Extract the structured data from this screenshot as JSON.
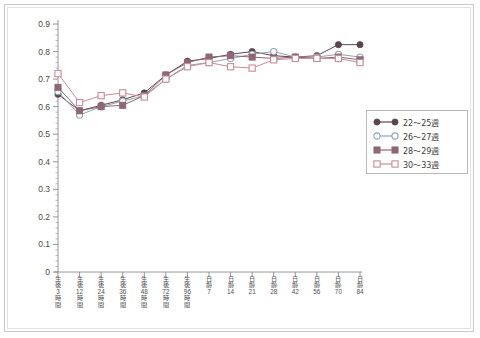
{
  "chart_data": {
    "type": "line",
    "title": "",
    "xlabel": "",
    "ylabel": "",
    "ylim": [
      0,
      0.9
    ],
    "ytick_labels": [
      "0.9",
      "0.8",
      "0.7",
      "0.6",
      "0.5",
      "0.4",
      "0.3",
      "0.2",
      "0.1",
      "0"
    ],
    "ytick_values": [
      0.9,
      0.8,
      0.7,
      0.6,
      0.5,
      0.4,
      0.3,
      0.2,
      0.1,
      0
    ],
    "grid": false,
    "legend_position": "right-middle",
    "categories": [
      "生後3時間",
      "生後12時間",
      "生後24時間",
      "生後36時間",
      "生後48時間",
      "生後72時間",
      "生後96時間",
      "日齢7",
      "日齢14",
      "日齢21",
      "日齢28",
      "日齢42",
      "日齢56",
      "日齢70",
      "日齢84"
    ],
    "category_parts": [
      {
        "head": "生後",
        "num": "3",
        "tail": "時間"
      },
      {
        "head": "生後",
        "num": "12",
        "tail": "時間"
      },
      {
        "head": "生後",
        "num": "24",
        "tail": "時間"
      },
      {
        "head": "生後",
        "num": "36",
        "tail": "時間"
      },
      {
        "head": "生後",
        "num": "48",
        "tail": "時間"
      },
      {
        "head": "生後",
        "num": "72",
        "tail": "時間"
      },
      {
        "head": "生後",
        "num": "96",
        "tail": "時間"
      },
      {
        "head": "日齢",
        "num": "7",
        "tail": ""
      },
      {
        "head": "日齢",
        "num": "14",
        "tail": ""
      },
      {
        "head": "日齢",
        "num": "21",
        "tail": ""
      },
      {
        "head": "日齢",
        "num": "28",
        "tail": ""
      },
      {
        "head": "日齢",
        "num": "42",
        "tail": ""
      },
      {
        "head": "日齢",
        "num": "56",
        "tail": ""
      },
      {
        "head": "日齢",
        "num": "70",
        "tail": ""
      },
      {
        "head": "日齢",
        "num": "84",
        "tail": ""
      }
    ],
    "series": [
      {
        "name": "22～25週",
        "marker": "filled-circle",
        "color": "#5e4452",
        "values": [
          0.645,
          0.585,
          0.605,
          0.625,
          0.65,
          0.715,
          0.765,
          0.775,
          0.79,
          0.8,
          0.785,
          0.78,
          0.785,
          0.825,
          0.825
        ]
      },
      {
        "name": "26～27週",
        "marker": "open-circle",
        "color": "#8fa6ae",
        "values": [
          0.655,
          0.57,
          0.6,
          0.62,
          0.64,
          0.7,
          0.75,
          0.76,
          0.775,
          0.79,
          0.8,
          0.78,
          0.78,
          0.79,
          0.78
        ]
      },
      {
        "name": "28～29週",
        "marker": "filled-square",
        "color": "#8f6676",
        "values": [
          0.67,
          0.585,
          0.6,
          0.605,
          0.64,
          0.715,
          0.76,
          0.78,
          0.785,
          0.78,
          0.775,
          0.78,
          0.775,
          0.78,
          0.77
        ]
      },
      {
        "name": "30～33週",
        "marker": "open-square",
        "color": "#c98b93",
        "values": [
          0.72,
          0.615,
          0.64,
          0.65,
          0.635,
          0.7,
          0.745,
          0.76,
          0.745,
          0.74,
          0.77,
          0.775,
          0.775,
          0.775,
          0.76
        ]
      }
    ]
  },
  "legend": {
    "items": [
      {
        "label": "22～25週",
        "marker": "filled-circle",
        "color": "#5e4452"
      },
      {
        "label": "26～27週",
        "marker": "open-circle",
        "color": "#8fa6ae"
      },
      {
        "label": "28～29週",
        "marker": "filled-square",
        "color": "#8f6676"
      },
      {
        "label": "30～33週",
        "marker": "open-square",
        "color": "#c98b93"
      }
    ]
  },
  "axis": {
    "y_max_label": "0.9",
    "y_min_label": "0"
  }
}
